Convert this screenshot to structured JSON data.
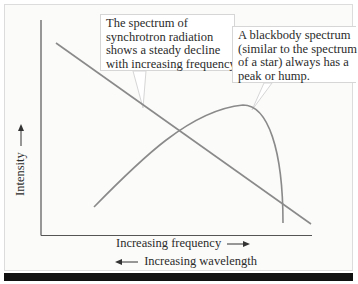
{
  "figure": {
    "callouts": [
      {
        "lines": [
          "The spectrum of",
          "synchrotron radiation",
          "shows a steady decline",
          "with increasing frequency."
        ]
      },
      {
        "lines": [
          "A blackbody spectrum",
          "(similar to the spectrum",
          "of a star) always has a",
          "peak or hump."
        ]
      }
    ],
    "axes": {
      "y_label": "Intensity",
      "x_label_primary": "Increasing frequency",
      "x_label_secondary": "Increasing wavelength"
    },
    "curves": [
      {
        "name": "synchrotron spectrum",
        "shape": "straight line, steadily decreasing"
      },
      {
        "name": "blackbody spectrum",
        "shape": "rises to a peak then falls sharply"
      }
    ],
    "colors": {
      "curve": "#8a8a8a",
      "axis": "#555555",
      "bottom_bar": "#111111"
    }
  }
}
